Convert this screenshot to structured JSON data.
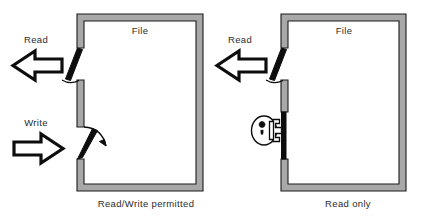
{
  "figure": {
    "background_color": "#ffffff",
    "wall_color": "#a8a8a8",
    "outline_color": "#0d0d0d"
  },
  "panels": [
    {
      "id": "read-write",
      "room_label": "File",
      "caption": "Read/Write permitted",
      "operations": [
        {
          "name": "read",
          "label": "Read",
          "direction": "out",
          "door_state": "open"
        },
        {
          "name": "write",
          "label": "Write",
          "direction": "in",
          "door_state": "open"
        }
      ],
      "lock": {
        "present": false,
        "state": ""
      }
    },
    {
      "id": "read-only",
      "room_label": "File",
      "caption": "Read only",
      "operations": [
        {
          "name": "read",
          "label": "Read",
          "direction": "out",
          "door_state": "open"
        },
        {
          "name": "write",
          "label": "",
          "direction": "in",
          "door_state": "locked"
        }
      ],
      "lock": {
        "present": true,
        "state": "locked",
        "icon": "padlock-icon"
      }
    }
  ]
}
